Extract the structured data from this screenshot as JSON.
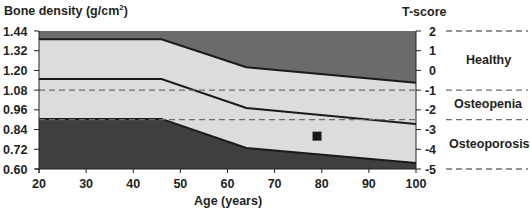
{
  "chart_data": {
    "type": "area",
    "title": "",
    "ylabel": "Bone density (g/cm²)",
    "ylabel_base": "Bone density (g/cm",
    "ylabel_sup": "2",
    "ylabel_close": ")",
    "y2label": "T-score",
    "xlabel": "Age (years)",
    "xlim": [
      20,
      100
    ],
    "ylim": [
      0.6,
      1.44
    ],
    "y2lim": [
      -5,
      2
    ],
    "x_ticks": [
      20,
      30,
      40,
      50,
      60,
      70,
      80,
      90,
      100
    ],
    "y_ticks": [
      "1.44",
      "1.32",
      "1.20",
      "1.08",
      "0.96",
      "0.84",
      "0.72",
      "0.60"
    ],
    "y_tick_values": [
      1.44,
      1.32,
      1.2,
      1.08,
      0.96,
      0.84,
      0.72,
      0.6
    ],
    "y2_ticks": [
      "2",
      "1",
      "0",
      "-1",
      "-2",
      "-3",
      "-4",
      "-5"
    ],
    "y2_tick_values": [
      2,
      1,
      0,
      -1,
      -2,
      -3,
      -4,
      -5
    ],
    "grid": false,
    "series": [
      {
        "name": "Upper reference boundary",
        "x": [
          20,
          46,
          64,
          100
        ],
        "values": [
          1.39,
          1.39,
          1.22,
          1.125
        ]
      },
      {
        "name": "Mean reference",
        "x": [
          20,
          46,
          64,
          100
        ],
        "values": [
          1.148,
          1.148,
          0.971,
          0.874
        ]
      },
      {
        "name": "Lower reference boundary",
        "x": [
          20,
          46,
          64,
          100
        ],
        "values": [
          0.905,
          0.905,
          0.728,
          0.636
        ]
      }
    ],
    "reference_lines": [
      {
        "t_score": -1,
        "bmd": 1.08,
        "style": "dashed"
      },
      {
        "t_score": -2.5,
        "bmd": 0.9,
        "style": "dashed"
      }
    ],
    "right_dividers_t_score": [
      2,
      -1,
      -2.5,
      -5
    ],
    "categories": [
      {
        "label": "Healthy",
        "t_range": [
          -1,
          2
        ]
      },
      {
        "label": "Osteopenia",
        "t_range": [
          -2.5,
          -1
        ]
      },
      {
        "label": "Osteoporosis",
        "t_range": [
          -5,
          -2.5
        ]
      }
    ],
    "points": [
      {
        "x": 79,
        "y": 0.8,
        "marker": "square"
      }
    ],
    "colors": {
      "dark_band": "#6b6b6b",
      "darker_band": "#3f3f3f",
      "light_band": "#dcdcdc",
      "line": "#1a1a1a",
      "dash": "#6e6e6e",
      "marker": "#1a1a1a"
    }
  }
}
